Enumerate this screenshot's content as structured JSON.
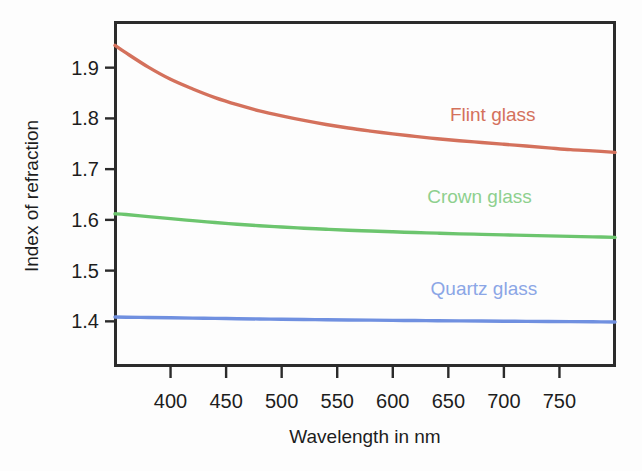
{
  "chart_data": {
    "type": "line",
    "title": "",
    "xlabel": "Wavelength in nm",
    "ylabel": "Index of refraction",
    "xlim": [
      350,
      800
    ],
    "ylim": [
      1.312,
      1.99
    ],
    "xticks": [
      400,
      450,
      500,
      550,
      600,
      650,
      700,
      750
    ],
    "xtick_labels": [
      "400",
      "450",
      "500",
      "550",
      "600",
      "650",
      "700",
      "750"
    ],
    "yticks": [
      1.4,
      1.5,
      1.6,
      1.7,
      1.8,
      1.9
    ],
    "ytick_labels": [
      "1.4",
      "1.5",
      "1.6",
      "1.7",
      "1.8",
      "1.9"
    ],
    "grid": false,
    "legend_position": "inline-right",
    "x": [
      350,
      360,
      380,
      400,
      420,
      440,
      460,
      480,
      500,
      520,
      540,
      560,
      580,
      600,
      620,
      640,
      660,
      680,
      700,
      720,
      740,
      760,
      780,
      800
    ],
    "series": [
      {
        "name": "Flint glass",
        "color": "#d4715c",
        "label_color": "#d4715c",
        "label_x": 690,
        "label_y": 1.795,
        "values": [
          1.944,
          1.929,
          1.901,
          1.877,
          1.858,
          1.841,
          1.827,
          1.815,
          1.805,
          1.796,
          1.788,
          1.781,
          1.775,
          1.7695,
          1.7645,
          1.76,
          1.756,
          1.7525,
          1.749,
          1.7455,
          1.742,
          1.7385,
          1.736,
          1.733
        ]
      },
      {
        "name": "Crown glass",
        "color": "#6cc56e",
        "label_color": "#8ed08e",
        "label_x": 678,
        "label_y": 1.634,
        "values": [
          1.612,
          1.6105,
          1.6065,
          1.6025,
          1.5985,
          1.5948,
          1.5915,
          1.5885,
          1.586,
          1.5835,
          1.5815,
          1.5795,
          1.578,
          1.5765,
          1.575,
          1.5738,
          1.5725,
          1.5715,
          1.5705,
          1.5695,
          1.5685,
          1.5675,
          1.5665,
          1.5655
        ]
      },
      {
        "name": "Quartz glass",
        "color": "#7090e0",
        "label_color": "#8ba6e6",
        "label_x": 682,
        "label_y": 1.452,
        "values": [
          1.4085,
          1.4082,
          1.4076,
          1.407,
          1.4064,
          1.4058,
          1.4052,
          1.4047,
          1.4042,
          1.4037,
          1.4032,
          1.4028,
          1.4024,
          1.402,
          1.4016,
          1.4013,
          1.4009,
          1.4006,
          1.4003,
          1.4,
          1.3997,
          1.3994,
          1.3991,
          1.3988
        ]
      }
    ]
  },
  "figure": {
    "background_color": "#fdfdfd",
    "axis_color": "#2b2b2b"
  }
}
